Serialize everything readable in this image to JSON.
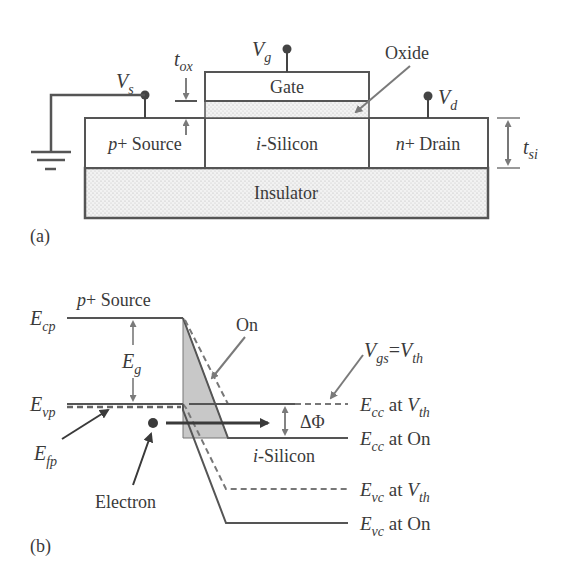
{
  "panel_a": {
    "label": "(a)",
    "regions": {
      "gate": "Gate",
      "source": "Source",
      "source_prefix": "p",
      "channel": "-Silicon",
      "channel_prefix": "i",
      "drain": "Drain",
      "drain_prefix": "n",
      "plus": "+",
      "insulator": "Insulator"
    },
    "labels": {
      "oxide": "Oxide",
      "vs_main": "V",
      "vs_sub": "s",
      "vg_main": "V",
      "vg_sub": "g",
      "vd_main": "V",
      "vd_sub": "d",
      "tox_main": "t",
      "tox_sub": "ox",
      "tsi_main": "t",
      "tsi_sub": "si"
    }
  },
  "panel_b": {
    "label": "(b)",
    "labels": {
      "source_prefix": "p",
      "source": "+ Source",
      "ecp_main": "E",
      "ecp_sub": "cp",
      "evp_main": "E",
      "evp_sub": "vp",
      "efp_main": "E",
      "efp_sub": "fp",
      "eg_main": "E",
      "eg_sub": "g",
      "on": "On",
      "vgs_main": "V",
      "vgs_sub": "gs",
      "equals": "=",
      "vth_main": "V",
      "vth_sub": "th",
      "delta_phi": "ΔΦ",
      "channel_prefix": "i",
      "channel": "-Silicon",
      "electron": "Electron"
    },
    "legend": [
      {
        "main": "E",
        "sub": "cc",
        "text": " at ",
        "tail_main": "V",
        "tail_sub": "th",
        "style": "dashed"
      },
      {
        "main": "E",
        "sub": "cc",
        "text": " at On",
        "tail_main": "",
        "tail_sub": "",
        "style": "solid"
      },
      {
        "main": "E",
        "sub": "vc",
        "text": " at ",
        "tail_main": "V",
        "tail_sub": "th",
        "style": "dashed"
      },
      {
        "main": "E",
        "sub": "vc",
        "text": " at On",
        "tail_main": "",
        "tail_sub": "",
        "style": "solid"
      }
    ]
  },
  "colors": {
    "line": "#555555",
    "dark": "#3a3a3a",
    "shade": "#c8c8c8",
    "arrow_gray": "#7a7a7a"
  }
}
